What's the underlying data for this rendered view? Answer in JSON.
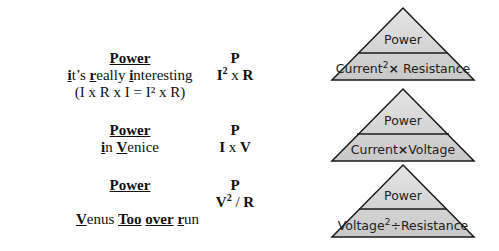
{
  "rows": [
    {
      "title": "Power",
      "mnemonic": {
        "parts": [
          {
            "t": "i",
            "b": true
          },
          {
            "t": "t’s ",
            "b": false
          },
          {
            "t": "r",
            "b": true
          },
          {
            "t": "eally ",
            "b": false
          },
          {
            "t": "i",
            "b": true
          },
          {
            "t": "nteresting",
            "b": false
          }
        ]
      },
      "note": "(I x R x I = I² x R)",
      "formula_top": "P",
      "formula": {
        "a": "I",
        "sup": "2",
        "op": " x ",
        "b": "R"
      },
      "triangle": {
        "top": "Power",
        "left": "Current",
        "left_sup": "2",
        "op": "×",
        "right": "Resistance"
      }
    },
    {
      "title": "Power",
      "mnemonic": {
        "parts": [
          {
            "t": "i",
            "b": true
          },
          {
            "t": "n ",
            "b": false
          },
          {
            "t": "V",
            "b": true
          },
          {
            "t": "enice",
            "b": false
          }
        ]
      },
      "formula_top": "P",
      "formula": {
        "a": "I",
        "sup": "",
        "op": " x ",
        "b": "V"
      },
      "triangle": {
        "top": "Power",
        "left": "Current",
        "left_sup": "",
        "op": "×",
        "right": "Voltage"
      }
    },
    {
      "title": "Power",
      "mnemonic": {
        "parts": [
          {
            "t": "V",
            "b": true
          },
          {
            "t": "enus ",
            "b": false
          },
          {
            "t": "Too",
            "b": true
          },
          {
            "t": " ",
            "b": false
          },
          {
            "t": "over",
            "b": true
          },
          {
            "t": " ",
            "b": false
          },
          {
            "t": "r",
            "b": true
          },
          {
            "t": "un",
            "b": false
          }
        ]
      },
      "formula_top": "P",
      "formula": {
        "a": "V",
        "sup": "2",
        "op": " / ",
        "b": "R"
      },
      "triangle": {
        "top": "Power",
        "left": "Voltage",
        "left_sup": "2",
        "op": "÷",
        "right": "Resistance"
      }
    }
  ],
  "colors": {
    "triangle_fill": "#d6d6d6",
    "triangle_stroke": "#1a1a1a"
  }
}
